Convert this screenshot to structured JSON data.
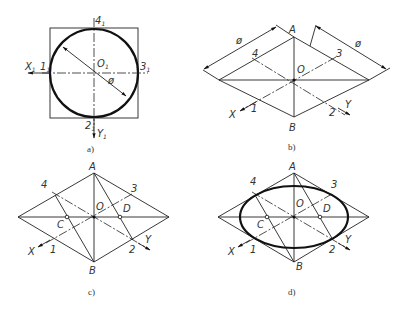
{
  "figure": {
    "panels": [
      {
        "id": "a",
        "caption": "a)",
        "labels": {
          "top": "4",
          "top_sub": "1",
          "bottom": "2",
          "bottom_sub": "1",
          "left_pt": "1",
          "left_pt_sub": "1",
          "right_pt": "3",
          "right_pt_sub": "1",
          "center": "O",
          "center_sub": "1",
          "x_axis": "X",
          "x_axis_sub": "1",
          "y_axis": "Y",
          "y_axis_sub": "1",
          "diameter": "ø"
        }
      },
      {
        "id": "b",
        "caption": "b)",
        "labels": {
          "A": "A",
          "B": "B",
          "O": "O",
          "p1": "1",
          "p2": "2",
          "p3": "3",
          "p4": "4",
          "x_axis": "X",
          "y_axis": "Y",
          "diameter_left": "ø",
          "diameter_right": "ø"
        }
      },
      {
        "id": "c",
        "caption": "c)",
        "labels": {
          "A": "A",
          "B": "B",
          "O": "O",
          "C": "C",
          "D": "D",
          "p1": "1",
          "p2": "2",
          "p3": "3",
          "p4": "4",
          "x_axis": "X",
          "y_axis": "Y"
        }
      },
      {
        "id": "d",
        "caption": "d)",
        "labels": {
          "A": "A",
          "B": "B",
          "O": "O",
          "C": "C",
          "D": "D",
          "p1": "1",
          "p2": "2",
          "p3": "3",
          "p4": "4",
          "x_axis": "X",
          "y_axis": "Y"
        }
      }
    ]
  }
}
